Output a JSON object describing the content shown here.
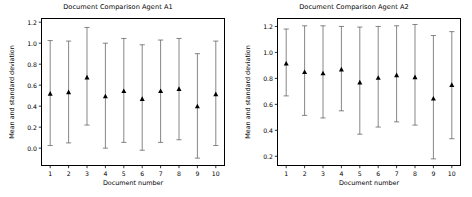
{
  "figure": {
    "width": 472,
    "height": 197,
    "background": "#ffffff",
    "foreground": "#000000"
  },
  "panels": [
    {
      "id": "agent-a1",
      "title": "Document Comparison Agent A1",
      "xlabel": "Document number",
      "ylabel": "Mean and standard deviation"
    },
    {
      "id": "agent-a2",
      "title": "Document Comparison Agent A2",
      "xlabel": "Document number",
      "ylabel": "Mean and standard deviation"
    }
  ],
  "chart_data": [
    {
      "type": "scatter",
      "title": "Document Comparison Agent A1",
      "xlabel": "Document number",
      "ylabel": "Mean and standard deviation",
      "x": [
        1,
        2,
        3,
        4,
        5,
        6,
        7,
        8,
        9,
        10
      ],
      "xtick_labels": [
        "1",
        "2",
        "3",
        "4",
        "5",
        "6",
        "7",
        "8",
        "9",
        "10"
      ],
      "ytick_labels": [
        "0.0",
        "0.2",
        "0.4",
        "0.6",
        "0.8",
        "1.0",
        "1.2"
      ],
      "yticks": [
        0.0,
        0.2,
        0.4,
        0.6,
        0.8,
        1.0,
        1.2
      ],
      "xlim": [
        0.5,
        10.5
      ],
      "ylim": [
        -0.17,
        1.24
      ],
      "grid": false,
      "legend": null,
      "marker": "triangle-up",
      "marker_color": "#000000",
      "errorbar_color": "#555555",
      "series": [
        {
          "name": "mean",
          "values": [
            0.52,
            0.535,
            0.675,
            0.495,
            0.545,
            0.47,
            0.545,
            0.565,
            0.4,
            0.515
          ]
        },
        {
          "name": "upper",
          "values": [
            1.025,
            1.02,
            1.15,
            1.0,
            1.045,
            0.985,
            1.03,
            1.045,
            0.9,
            1.02
          ]
        },
        {
          "name": "lower",
          "values": [
            0.025,
            0.05,
            0.22,
            0.0,
            0.055,
            -0.02,
            0.055,
            0.08,
            -0.095,
            0.025
          ]
        }
      ]
    },
    {
      "type": "scatter",
      "title": "Document Comparison Agent A2",
      "xlabel": "Document number",
      "ylabel": "Mean and standard deviation",
      "x": [
        1,
        2,
        3,
        4,
        5,
        6,
        7,
        8,
        9,
        10
      ],
      "xtick_labels": [
        "1",
        "2",
        "3",
        "4",
        "5",
        "6",
        "7",
        "8",
        "9",
        "10"
      ],
      "ytick_labels": [
        "0.2",
        "0.4",
        "0.6",
        "0.8",
        "1.0",
        "1.2"
      ],
      "yticks": [
        0.2,
        0.4,
        0.6,
        0.8,
        1.0,
        1.2
      ],
      "xlim": [
        0.5,
        10.5
      ],
      "ylim": [
        0.125,
        1.265
      ],
      "grid": false,
      "legend": null,
      "marker": "triangle-up",
      "marker_color": "#000000",
      "errorbar_color": "#555555",
      "series": [
        {
          "name": "mean",
          "values": [
            0.915,
            0.85,
            0.84,
            0.87,
            0.77,
            0.805,
            0.825,
            0.81,
            0.645,
            0.75
          ]
        },
        {
          "name": "upper",
          "values": [
            1.18,
            1.205,
            1.205,
            1.2,
            1.195,
            1.2,
            1.205,
            1.215,
            1.13,
            1.16
          ]
        },
        {
          "name": "lower",
          "values": [
            0.665,
            0.515,
            0.495,
            0.55,
            0.37,
            0.425,
            0.465,
            0.44,
            0.18,
            0.335
          ]
        }
      ]
    }
  ]
}
